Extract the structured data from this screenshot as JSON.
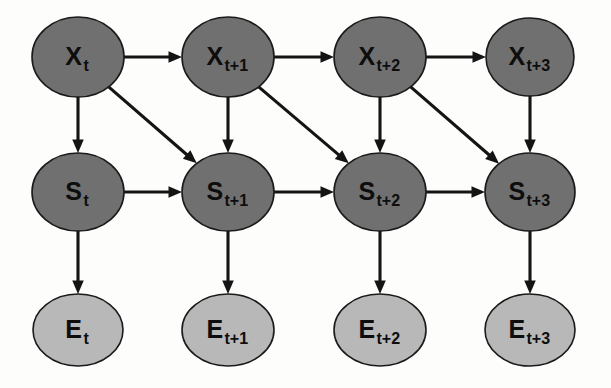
{
  "diagram": {
    "canvas": {
      "width": 611,
      "height": 388,
      "background": "#fdfdfc"
    },
    "colors": {
      "node_dark_fill": "#707070",
      "node_light_fill": "#b8b8b8",
      "node_stroke": "#1a1a1a",
      "edge": "#141414",
      "label": "#0d0d0d"
    },
    "rows": [
      {
        "id": "row-x",
        "variable": "X",
        "role": "hidden-state",
        "fill": "#707070"
      },
      {
        "id": "row-s",
        "variable": "S",
        "role": "intermediate-state",
        "fill": "#707070"
      },
      {
        "id": "row-e",
        "variable": "E",
        "role": "evidence",
        "fill": "#b8b8b8"
      }
    ],
    "time_steps": [
      "t",
      "t+1",
      "t+2",
      "t+3"
    ],
    "nodes": [
      {
        "id": "X_t",
        "main": "X",
        "sub": "t",
        "cx": 78,
        "cy": 57,
        "rx": 46,
        "ry": 40,
        "fill": "#707070",
        "row": "X"
      },
      {
        "id": "X_t1",
        "main": "X",
        "sub": "t+1",
        "cx": 228,
        "cy": 57,
        "rx": 46,
        "ry": 40,
        "fill": "#707070",
        "row": "X"
      },
      {
        "id": "X_t2",
        "main": "X",
        "sub": "t+2",
        "cx": 380,
        "cy": 57,
        "rx": 46,
        "ry": 40,
        "fill": "#707070",
        "row": "X"
      },
      {
        "id": "X_t3",
        "main": "X",
        "sub": "t+3",
        "cx": 530,
        "cy": 57,
        "rx": 44,
        "ry": 39,
        "fill": "#707070",
        "row": "X"
      },
      {
        "id": "S_t",
        "main": "S",
        "sub": "t",
        "cx": 78,
        "cy": 192,
        "rx": 46,
        "ry": 39,
        "fill": "#707070",
        "row": "S"
      },
      {
        "id": "S_t1",
        "main": "S",
        "sub": "t+1",
        "cx": 228,
        "cy": 192,
        "rx": 46,
        "ry": 39,
        "fill": "#707070",
        "row": "S"
      },
      {
        "id": "S_t2",
        "main": "S",
        "sub": "t+2",
        "cx": 380,
        "cy": 192,
        "rx": 46,
        "ry": 39,
        "fill": "#707070",
        "row": "S"
      },
      {
        "id": "S_t3",
        "main": "S",
        "sub": "t+3",
        "cx": 530,
        "cy": 192,
        "rx": 45,
        "ry": 39,
        "fill": "#707070",
        "row": "S"
      },
      {
        "id": "E_t",
        "main": "E",
        "sub": "t",
        "cx": 78,
        "cy": 330,
        "rx": 45,
        "ry": 36,
        "fill": "#b8b8b8",
        "row": "E"
      },
      {
        "id": "E_t1",
        "main": "E",
        "sub": "t+1",
        "cx": 228,
        "cy": 330,
        "rx": 46,
        "ry": 36,
        "fill": "#b8b8b8",
        "row": "E"
      },
      {
        "id": "E_t2",
        "main": "E",
        "sub": "t+2",
        "cx": 380,
        "cy": 330,
        "rx": 46,
        "ry": 36,
        "fill": "#b8b8b8",
        "row": "E"
      },
      {
        "id": "E_t3",
        "main": "E",
        "sub": "t+3",
        "cx": 530,
        "cy": 330,
        "rx": 45,
        "ry": 36,
        "fill": "#b8b8b8",
        "row": "E"
      }
    ],
    "edges": [
      {
        "id": "e-Xt-Xt1",
        "from": "X_t",
        "to": "X_t1",
        "kind": "horizontal"
      },
      {
        "id": "e-Xt1-Xt2",
        "from": "X_t1",
        "to": "X_t2",
        "kind": "horizontal"
      },
      {
        "id": "e-Xt2-Xt3",
        "from": "X_t2",
        "to": "X_t3",
        "kind": "horizontal"
      },
      {
        "id": "e-Xt-St",
        "from": "X_t",
        "to": "S_t",
        "kind": "vertical"
      },
      {
        "id": "e-Xt1-St1",
        "from": "X_t1",
        "to": "S_t1",
        "kind": "vertical"
      },
      {
        "id": "e-Xt2-St2",
        "from": "X_t2",
        "to": "S_t2",
        "kind": "vertical"
      },
      {
        "id": "e-Xt3-St3",
        "from": "X_t3",
        "to": "S_t3",
        "kind": "vertical"
      },
      {
        "id": "e-Xt-St1",
        "from": "X_t",
        "to": "S_t1",
        "kind": "diagonal"
      },
      {
        "id": "e-Xt1-St2",
        "from": "X_t1",
        "to": "S_t2",
        "kind": "diagonal"
      },
      {
        "id": "e-Xt2-St3",
        "from": "X_t2",
        "to": "S_t3",
        "kind": "diagonal"
      },
      {
        "id": "e-St-St1",
        "from": "S_t",
        "to": "S_t1",
        "kind": "horizontal"
      },
      {
        "id": "e-St1-St2",
        "from": "S_t1",
        "to": "S_t2",
        "kind": "horizontal"
      },
      {
        "id": "e-St2-St3",
        "from": "S_t2",
        "to": "S_t3",
        "kind": "horizontal"
      },
      {
        "id": "e-St-Et",
        "from": "S_t",
        "to": "E_t",
        "kind": "vertical"
      },
      {
        "id": "e-St1-Et1",
        "from": "S_t1",
        "to": "E_t1",
        "kind": "vertical"
      },
      {
        "id": "e-St2-Et2",
        "from": "S_t2",
        "to": "E_t2",
        "kind": "vertical"
      },
      {
        "id": "e-St3-Et3",
        "from": "S_t3",
        "to": "E_t3",
        "kind": "vertical"
      }
    ]
  }
}
